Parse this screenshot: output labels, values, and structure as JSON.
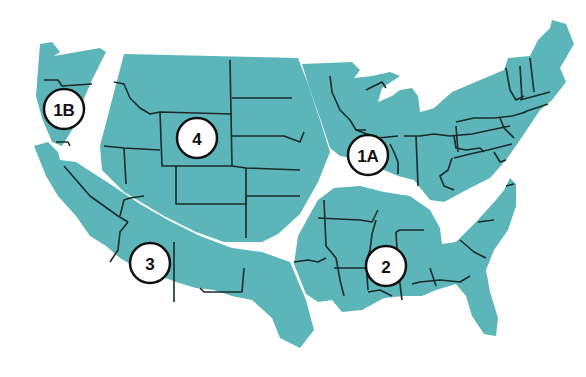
{
  "map": {
    "title": "",
    "subject": "United States divided into numbered zones",
    "fill_color": "#5cb6b9",
    "border_color": "#1a2a2c",
    "background_color": "#ffffff",
    "zones": [
      {
        "id": "1B",
        "label": "1B",
        "area": "Pacific Northwest"
      },
      {
        "id": "4",
        "label": "4",
        "area": "Northern Rockies / Great Plains"
      },
      {
        "id": "1A",
        "label": "1A",
        "area": "Midwest / Northeast"
      },
      {
        "id": "3",
        "label": "3",
        "area": "Southwest / California"
      },
      {
        "id": "2",
        "label": "2",
        "area": "South / Southeast"
      }
    ]
  }
}
